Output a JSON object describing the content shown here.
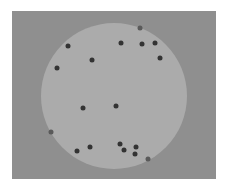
{
  "panel": {
    "x": 12,
    "y": 11,
    "width": 204,
    "height": 168,
    "color": "#8f8f8f"
  },
  "disc": {
    "cx": 114,
    "cy": 96,
    "r": 73,
    "color": "#ababab"
  },
  "dot_color": "#333333",
  "dots": [
    {
      "x": 140,
      "y": 28,
      "edge": true
    },
    {
      "x": 68,
      "y": 46
    },
    {
      "x": 121,
      "y": 43
    },
    {
      "x": 142,
      "y": 44
    },
    {
      "x": 155,
      "y": 43
    },
    {
      "x": 92,
      "y": 60
    },
    {
      "x": 160,
      "y": 58
    },
    {
      "x": 57,
      "y": 68
    },
    {
      "x": 83,
      "y": 108
    },
    {
      "x": 116,
      "y": 106
    },
    {
      "x": 51,
      "y": 132,
      "edge": true
    },
    {
      "x": 90,
      "y": 147
    },
    {
      "x": 77,
      "y": 151
    },
    {
      "x": 120,
      "y": 144
    },
    {
      "x": 124,
      "y": 150
    },
    {
      "x": 136,
      "y": 147
    },
    {
      "x": 135,
      "y": 154
    },
    {
      "x": 148,
      "y": 159,
      "edge": true
    }
  ]
}
